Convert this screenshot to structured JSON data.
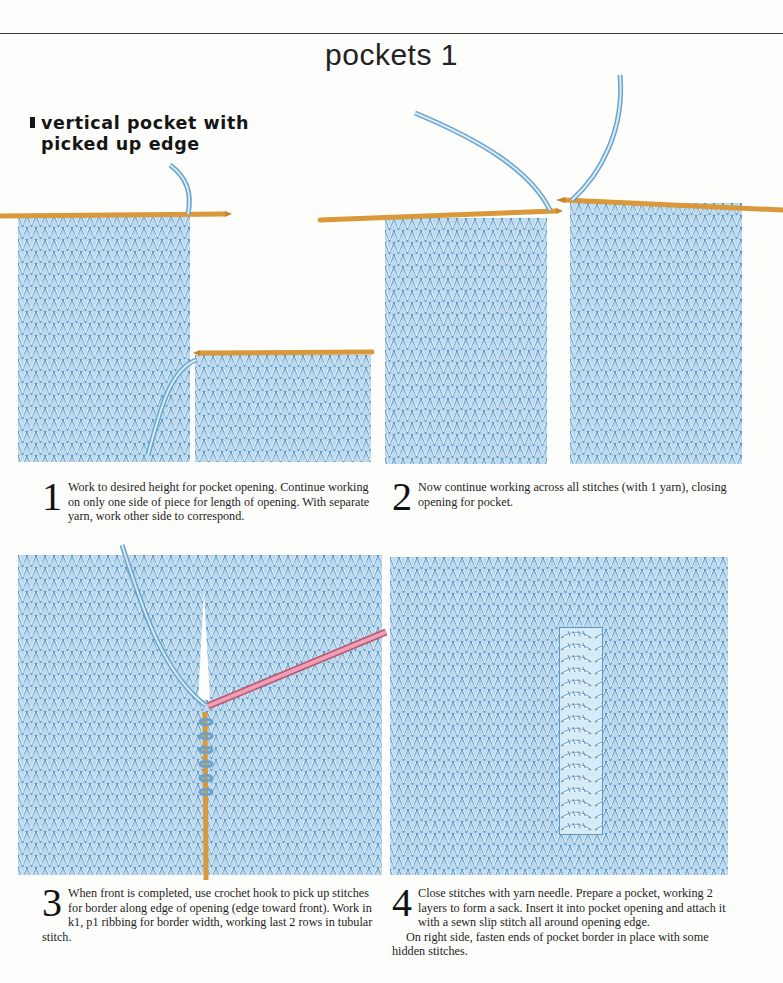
{
  "page": {
    "title": "pockets 1",
    "section_heading_line1": "vertical pocket with",
    "section_heading_line2": "picked up edge"
  },
  "colors": {
    "yarn_blue": "#6aa3cc",
    "yarn_light": "#cfe6f5",
    "needle_orange": "#d9983a",
    "needle_yellow": "#e9c44a",
    "crochet_hook_pink": "#e59ab0",
    "rule": "#3a3a3a"
  },
  "steps": [
    {
      "number": "1",
      "text": "Work to desired height for pocket opening. Continue working on only one side of piece for length of opening. With separate yarn, work other side to correspond.",
      "illustration": "knitted-fabric-split-on-two-needles"
    },
    {
      "number": "2",
      "text": "Now continue working across all stitches (with 1 yarn), closing opening for pocket.",
      "illustration": "knitted-fabric-joined-on-needle"
    },
    {
      "number": "3",
      "text": "When front is completed, use crochet hook to pick up stitches for border along edge of opening (edge toward front). Work in k1, p1 ribbing for border width, working last 2 rows in tubular stitch.",
      "illustration": "crochet-hook-picking-up-border-stitches"
    },
    {
      "number": "4",
      "text_para1": "Close stitches with yarn needle. Prepare a pocket, working 2 layers to form a sack. Insert it into pocket opening and attach it with a sewn slip stitch all around opening edge.",
      "text_para2": "On right side, fasten ends of pocket border in place with some hidden stitches.",
      "illustration": "finished-ribbed-pocket-border"
    }
  ]
}
